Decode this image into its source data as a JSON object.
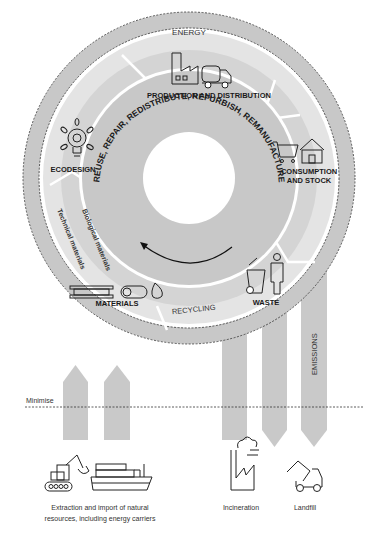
{
  "diagram": {
    "type": "circular-economy",
    "outer_ring_label": "ENERGY",
    "inner_ring_label": "REUSE, REPAIR, REDISTRIBUTE, REFURBISH, REMANUFACTURE",
    "stages": [
      {
        "id": "production",
        "label": "PRODUCTION AND DISTRIBUTION",
        "icon": "factory-truck-icon"
      },
      {
        "id": "consumption",
        "label_line1": "CONSUMPTION",
        "label_line2": "AND STOCK",
        "icon": "cart-house-icon"
      },
      {
        "id": "waste",
        "label": "WASTE",
        "icon": "person-bin-icon"
      },
      {
        "id": "materials",
        "label": "MATERIALS",
        "icon": "materials-icon"
      },
      {
        "id": "ecodesign",
        "label": "ECODESIGN",
        "icon": "lightbulb-icon"
      }
    ],
    "recycling_label": "RECYCLING",
    "biological_label": "Biological materials",
    "technical_label": "Technical materials",
    "emissions_label": "EMISSIONS",
    "minimise_label": "Minimise",
    "inputs": {
      "label_line1": "Extraction and import of natural",
      "label_line2": "resources, including energy carriers",
      "icons": [
        "excavator-icon",
        "cargo-ship-icon"
      ]
    },
    "outputs": [
      {
        "label": "Incineration",
        "icon": "incinerator-icon"
      },
      {
        "label": "Landfill",
        "icon": "dump-truck-icon"
      }
    ],
    "colors": {
      "ring_dark": "#c6c6c6",
      "ring_mid": "#d6d6d6",
      "ring_light": "#e6e6e6",
      "arrow": "#c9c9c9",
      "text": "#1a1a1a"
    }
  }
}
